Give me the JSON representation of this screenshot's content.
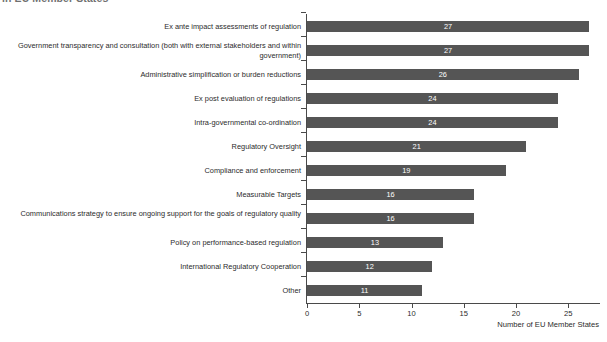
{
  "chart_data": {
    "type": "bar",
    "orientation": "horizontal",
    "title": "in EU Member States",
    "xlabel": "Number of EU Member States",
    "ylabel": "",
    "xlim": [
      0,
      28
    ],
    "xticks": [
      0,
      5,
      10,
      15,
      20,
      25
    ],
    "grid": false,
    "legend": null,
    "bar_color": "#555555",
    "value_label_color": "#ffffff",
    "categories": [
      "Ex ante impact assessments of regulation",
      "Government transparency and consultation (both with external stakeholders and within government)",
      "Administrative simplification or burden reductions",
      "Ex post evaluation of regulations",
      "Intra-governmental co-ordination",
      "Regulatory Oversight",
      "Compliance and enforcement",
      "Measurable Targets",
      "Communications strategy to ensure ongoing support for the goals of regulatory quality",
      "Policy on performance-based regulation",
      "International Regulatory Cooperation",
      "Other"
    ],
    "values": [
      27,
      27,
      26,
      24,
      24,
      21,
      19,
      16,
      16,
      13,
      12,
      11
    ],
    "value_labels": [
      "27",
      "27",
      "26",
      "24",
      "24",
      "21",
      "19",
      "16",
      "16",
      "13",
      "12",
      "11"
    ],
    "xtick_labels": [
      "0",
      "5",
      "10",
      "15",
      "20",
      "25"
    ]
  },
  "footnote": ""
}
